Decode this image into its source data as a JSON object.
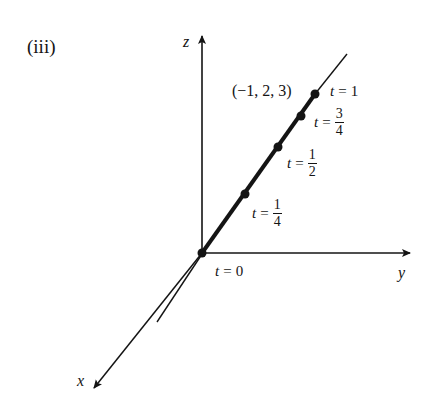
{
  "panel_label": "(iii)",
  "axes": {
    "x": "x",
    "y": "y",
    "z": "z"
  },
  "point_label": "(−1, 2, 3)",
  "parameter_labels": {
    "t0": {
      "var": "t",
      "eq": "=",
      "value": "0"
    },
    "t1": {
      "var": "t",
      "eq": "=",
      "value": "1"
    },
    "t34": {
      "var": "t",
      "eq": "=",
      "num": "3",
      "den": "4"
    },
    "t12": {
      "var": "t",
      "eq": "=",
      "num": "1",
      "den": "2"
    },
    "t14": {
      "var": "t",
      "eq": "=",
      "num": "1",
      "den": "4"
    }
  },
  "colors": {
    "ink": "#141414",
    "background": "#ffffff"
  },
  "line_description": "Line through origin (t = 0) and point (-1,2,3) (t = 1), with marked points at t = 1/4, 1/2, 3/4, 1"
}
